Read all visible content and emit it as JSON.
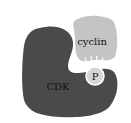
{
  "diagram": {
    "cdk": {
      "label": "CDK",
      "color": "#4a4a4a"
    },
    "cyclin": {
      "label": "cyclin",
      "color": "#c4c4c4"
    },
    "phosphate": {
      "label": "P",
      "color": "#d6d6d6",
      "stroke": "#ffffff"
    }
  }
}
